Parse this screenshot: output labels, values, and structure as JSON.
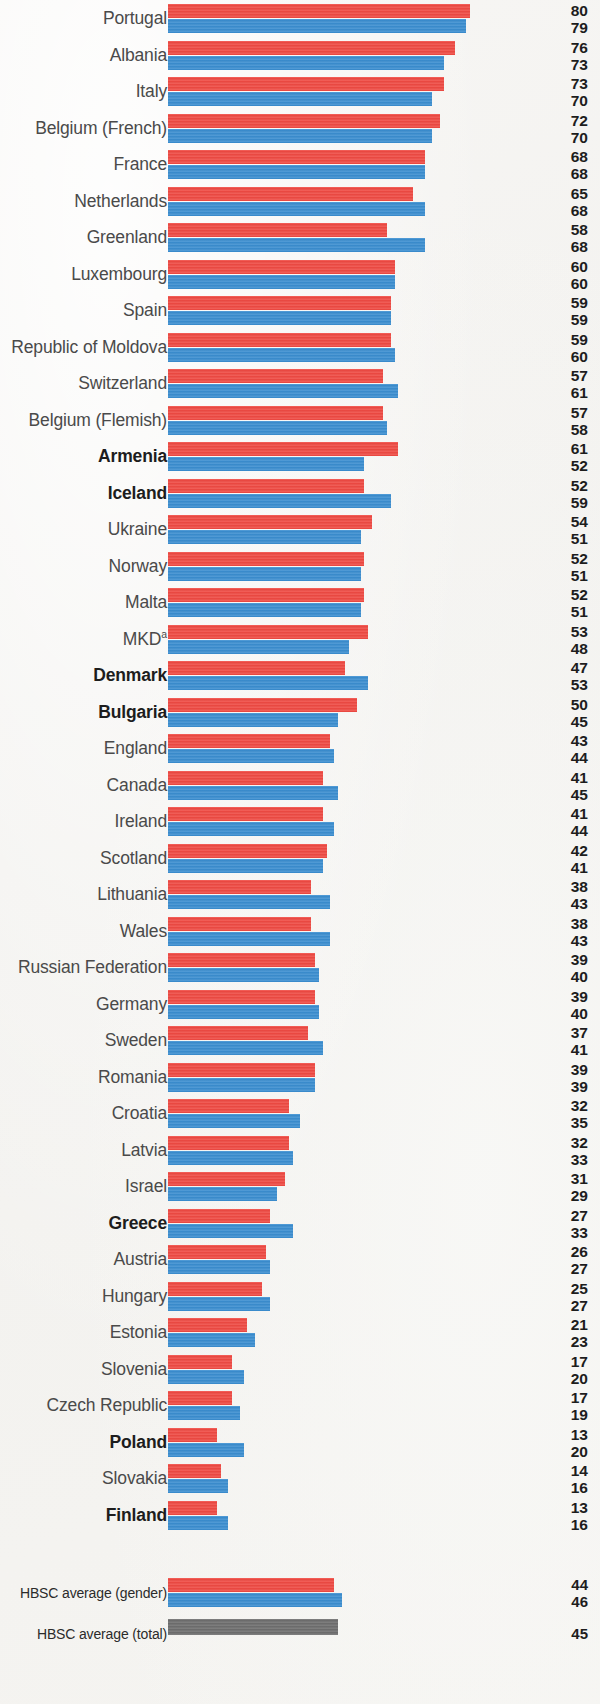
{
  "chart_data": {
    "type": "bar",
    "orientation": "horizontal",
    "title": "",
    "xlabel": "",
    "ylabel": "",
    "xlim": [
      0,
      80
    ],
    "grid": false,
    "legend_position": "none",
    "series": [
      {
        "name": "boys",
        "color": "#ef4a43"
      },
      {
        "name": "girls",
        "color": "#3b8ed0"
      },
      {
        "name": "total",
        "color": "#6e6e6e"
      }
    ],
    "categories": [
      "Portugal",
      "Albania",
      "Italy",
      "Belgium (French)",
      "France",
      "Netherlands",
      "Greenland",
      "Luxembourg",
      "Spain",
      "Republic of Moldova",
      "Switzerland",
      "Belgium (Flemish)",
      "Armenia",
      "Iceland",
      "Ukraine",
      "Norway",
      "Malta",
      "MKD",
      "Denmark",
      "Bulgaria",
      "England",
      "Canada",
      "Ireland",
      "Scotland",
      "Lithuania",
      "Wales",
      "Russian Federation",
      "Germany",
      "Sweden",
      "Romania",
      "Croatia",
      "Latvia",
      "Israel",
      "Greece",
      "Austria",
      "Hungary",
      "Estonia",
      "Slovenia",
      "Czech Republic",
      "Poland",
      "Slovakia",
      "Finland"
    ],
    "values_boys": [
      80,
      76,
      73,
      72,
      68,
      65,
      58,
      60,
      59,
      59,
      57,
      57,
      61,
      52,
      54,
      52,
      52,
      53,
      47,
      50,
      43,
      41,
      41,
      42,
      38,
      38,
      39,
      39,
      37,
      39,
      32,
      32,
      31,
      27,
      26,
      25,
      21,
      17,
      17,
      13,
      14,
      13
    ],
    "values_girls": [
      79,
      73,
      70,
      70,
      68,
      68,
      68,
      60,
      59,
      60,
      61,
      58,
      52,
      59,
      51,
      51,
      51,
      48,
      53,
      45,
      44,
      45,
      44,
      41,
      43,
      43,
      40,
      40,
      41,
      39,
      35,
      33,
      29,
      33,
      27,
      27,
      23,
      20,
      19,
      20,
      16,
      16
    ],
    "averages": [
      {
        "label": "HBSC average (gender)",
        "boys": 44,
        "girls": 46
      },
      {
        "label": "HBSC average (total)",
        "total": 45
      }
    ]
  },
  "rows": [
    {
      "label": "Portugal",
      "bold": false,
      "sup": "",
      "boys": 80,
      "girls": 79
    },
    {
      "label": "Albania",
      "bold": false,
      "sup": "",
      "boys": 76,
      "girls": 73
    },
    {
      "label": "Italy",
      "bold": false,
      "sup": "",
      "boys": 73,
      "girls": 70
    },
    {
      "label": "Belgium (French)",
      "bold": false,
      "sup": "",
      "boys": 72,
      "girls": 70
    },
    {
      "label": "France",
      "bold": false,
      "sup": "",
      "boys": 68,
      "girls": 68
    },
    {
      "label": "Netherlands",
      "bold": false,
      "sup": "",
      "boys": 65,
      "girls": 68
    },
    {
      "label": "Greenland",
      "bold": false,
      "sup": "",
      "boys": 58,
      "girls": 68
    },
    {
      "label": "Luxembourg",
      "bold": false,
      "sup": "",
      "boys": 60,
      "girls": 60
    },
    {
      "label": "Spain",
      "bold": false,
      "sup": "",
      "boys": 59,
      "girls": 59
    },
    {
      "label": "Republic of Moldova",
      "bold": false,
      "sup": "",
      "boys": 59,
      "girls": 60
    },
    {
      "label": "Switzerland",
      "bold": false,
      "sup": "",
      "boys": 57,
      "girls": 61
    },
    {
      "label": "Belgium (Flemish)",
      "bold": false,
      "sup": "",
      "boys": 57,
      "girls": 58
    },
    {
      "label": "Armenia",
      "bold": true,
      "sup": "",
      "boys": 61,
      "girls": 52
    },
    {
      "label": "Iceland",
      "bold": true,
      "sup": "",
      "boys": 52,
      "girls": 59
    },
    {
      "label": "Ukraine",
      "bold": false,
      "sup": "",
      "boys": 54,
      "girls": 51
    },
    {
      "label": "Norway",
      "bold": false,
      "sup": "",
      "boys": 52,
      "girls": 51
    },
    {
      "label": "Malta",
      "bold": false,
      "sup": "",
      "boys": 52,
      "girls": 51
    },
    {
      "label": "MKD",
      "bold": false,
      "sup": "a",
      "boys": 53,
      "girls": 48
    },
    {
      "label": "Denmark",
      "bold": true,
      "sup": "",
      "boys": 47,
      "girls": 53
    },
    {
      "label": "Bulgaria",
      "bold": true,
      "sup": "",
      "boys": 50,
      "girls": 45
    },
    {
      "label": "England",
      "bold": false,
      "sup": "",
      "boys": 43,
      "girls": 44
    },
    {
      "label": "Canada",
      "bold": false,
      "sup": "",
      "boys": 41,
      "girls": 45
    },
    {
      "label": "Ireland",
      "bold": false,
      "sup": "",
      "boys": 41,
      "girls": 44
    },
    {
      "label": "Scotland",
      "bold": false,
      "sup": "",
      "boys": 42,
      "girls": 41
    },
    {
      "label": "Lithuania",
      "bold": false,
      "sup": "",
      "boys": 38,
      "girls": 43
    },
    {
      "label": "Wales",
      "bold": false,
      "sup": "",
      "boys": 38,
      "girls": 43
    },
    {
      "label": "Russian Federation",
      "bold": false,
      "sup": "",
      "boys": 39,
      "girls": 40
    },
    {
      "label": "Germany",
      "bold": false,
      "sup": "",
      "boys": 39,
      "girls": 40
    },
    {
      "label": "Sweden",
      "bold": false,
      "sup": "",
      "boys": 37,
      "girls": 41
    },
    {
      "label": "Romania",
      "bold": false,
      "sup": "",
      "boys": 39,
      "girls": 39
    },
    {
      "label": "Croatia",
      "bold": false,
      "sup": "",
      "boys": 32,
      "girls": 35
    },
    {
      "label": "Latvia",
      "bold": false,
      "sup": "",
      "boys": 32,
      "girls": 33
    },
    {
      "label": "Israel",
      "bold": false,
      "sup": "",
      "boys": 31,
      "girls": 29
    },
    {
      "label": "Greece",
      "bold": true,
      "sup": "",
      "boys": 27,
      "girls": 33
    },
    {
      "label": "Austria",
      "bold": false,
      "sup": "",
      "boys": 26,
      "girls": 27
    },
    {
      "label": "Hungary",
      "bold": false,
      "sup": "",
      "boys": 25,
      "girls": 27
    },
    {
      "label": "Estonia",
      "bold": false,
      "sup": "",
      "boys": 21,
      "girls": 23
    },
    {
      "label": "Slovenia",
      "bold": false,
      "sup": "",
      "boys": 17,
      "girls": 20
    },
    {
      "label": "Czech Republic",
      "bold": false,
      "sup": "",
      "boys": 17,
      "girls": 19
    },
    {
      "label": "Poland",
      "bold": true,
      "sup": "",
      "boys": 13,
      "girls": 20
    },
    {
      "label": "Slovakia",
      "bold": false,
      "sup": "",
      "boys": 14,
      "girls": 16
    },
    {
      "label": "Finland",
      "bold": true,
      "sup": "",
      "boys": 13,
      "girls": 16
    }
  ],
  "averages": {
    "gender": {
      "label": "HBSC average (gender)",
      "boys": 44,
      "girls": 46
    },
    "total": {
      "label": "HBSC average (total)",
      "total": 45
    }
  },
  "colors": {
    "boys": "#ef4a43",
    "girls": "#3b8ed0",
    "total": "#6e6e6e",
    "label_text": "#4a4a4a",
    "value_text": "#1d1d1d",
    "background": "#f4f3f1"
  },
  "scale": {
    "px_per_unit": 3.775,
    "bar_origin_x": 168,
    "max_value": 80
  }
}
